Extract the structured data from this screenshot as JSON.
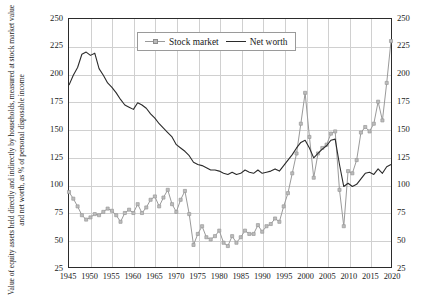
{
  "chart_data": {
    "type": "line",
    "title": "",
    "ylabel": "Value of equity assets held directly and indirectly by households, measured at stock market value and net worth, as % of personal disposable income",
    "xlabel": "",
    "ylim": [
      25,
      250
    ],
    "ytick_step": 25,
    "xlim": [
      1945,
      2020
    ],
    "xtick_step": 5,
    "grid": true,
    "legend_position": "top-center",
    "y_axis_both_sides": true,
    "ytick_labels": [
      "25",
      "50",
      "75",
      "100",
      "125",
      "150",
      "175",
      "200",
      "225",
      "250"
    ],
    "xtick_labels": [
      "1945",
      "1950",
      "1955",
      "1960",
      "1965",
      "1970",
      "1975",
      "1980",
      "1985",
      "1990",
      "1995",
      "2000",
      "2005",
      "2010",
      "2015",
      "2020"
    ],
    "x": [
      1945,
      1946,
      1947,
      1948,
      1949,
      1950,
      1951,
      1952,
      1953,
      1954,
      1955,
      1956,
      1957,
      1958,
      1959,
      1960,
      1961,
      1962,
      1963,
      1964,
      1965,
      1966,
      1967,
      1968,
      1969,
      1970,
      1971,
      1972,
      1973,
      1974,
      1975,
      1976,
      1977,
      1978,
      1979,
      1980,
      1981,
      1982,
      1983,
      1984,
      1985,
      1986,
      1987,
      1988,
      1989,
      1990,
      1991,
      1992,
      1993,
      1994,
      1995,
      1996,
      1997,
      1998,
      1999,
      2000,
      2001,
      2002,
      2003,
      2004,
      2005,
      2006,
      2007,
      2008,
      2009,
      2010,
      2011,
      2012,
      2013,
      2014,
      2015,
      2016,
      2017,
      2018,
      2019,
      2020
    ],
    "series": [
      {
        "name": "Stock market",
        "color": "#9a9a9a",
        "marker": "square",
        "values": [
          93,
          87,
          80,
          72,
          68,
          70,
          73,
          72,
          75,
          78,
          76,
          72,
          66,
          74,
          77,
          74,
          82,
          74,
          79,
          86,
          89,
          80,
          88,
          95,
          82,
          75,
          86,
          94,
          73,
          45,
          55,
          62,
          52,
          50,
          53,
          58,
          47,
          44,
          53,
          47,
          52,
          58,
          55,
          55,
          63,
          57,
          62,
          64,
          69,
          66,
          80,
          92,
          110,
          128,
          155,
          183,
          143,
          106,
          128,
          133,
          136,
          146,
          148,
          95,
          62,
          112,
          110,
          122,
          147,
          152,
          148,
          155,
          175,
          158,
          192,
          230
        ]
      },
      {
        "name": "Net worth",
        "color": "#2b2b2b",
        "marker": "none",
        "values": [
          190,
          199,
          206,
          218,
          220,
          217,
          219,
          205,
          199,
          192,
          188,
          183,
          177,
          172,
          170,
          168,
          174,
          172,
          169,
          164,
          160,
          155,
          151,
          147,
          143,
          136,
          133,
          130,
          126,
          120,
          118,
          117,
          115,
          113,
          113,
          112,
          110,
          109,
          111,
          109,
          110,
          113,
          111,
          110,
          113,
          110,
          111,
          112,
          114,
          112,
          117,
          122,
          127,
          133,
          138,
          140,
          133,
          124,
          128,
          132,
          135,
          140,
          141,
          118,
          98,
          101,
          98,
          100,
          105,
          110,
          111,
          109,
          114,
          110,
          116,
          118
        ]
      }
    ]
  },
  "legend": {
    "items": [
      {
        "label": "Stock market"
      },
      {
        "label": "Net worth"
      }
    ]
  }
}
